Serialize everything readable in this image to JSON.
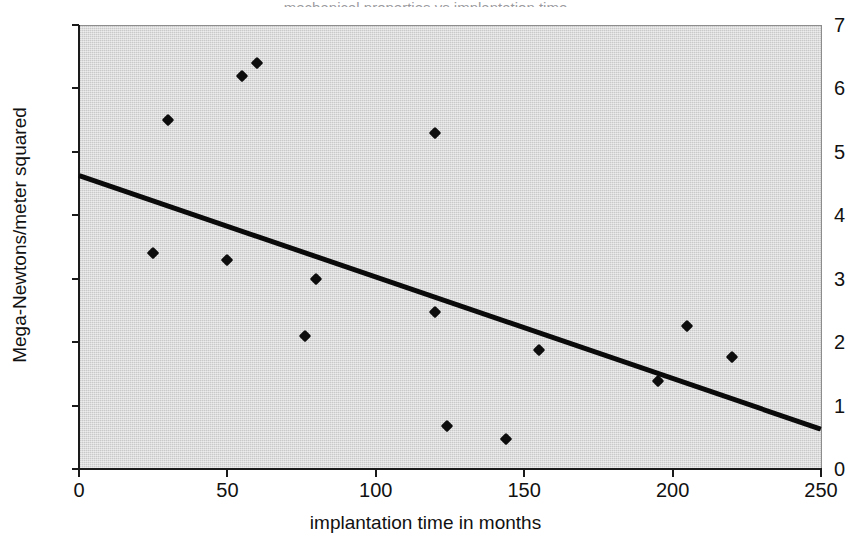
{
  "figure": {
    "background_color": "#ffffff",
    "plot_background_color": "#c9c9c9",
    "axis_color": "#1a1a1a",
    "marker_color": "#0d0d0d",
    "trend_color": "#0a0a0a",
    "cropped_title_sliver": "mechanical properties vs implantation time"
  },
  "chart_data": {
    "type": "scatter",
    "title": "",
    "xlabel": "implantation time in months",
    "ylabel": "Mega-Newtons/meter squared",
    "xlim": [
      0,
      250
    ],
    "ylim": [
      0,
      7
    ],
    "grid": false,
    "legend": null,
    "xticks": [
      0,
      50,
      100,
      150,
      200,
      250
    ],
    "xtick_labels": [
      "0",
      "50",
      "100",
      "150",
      "200",
      "250"
    ],
    "yticks": [
      0,
      1,
      2,
      3,
      4,
      5,
      6,
      7
    ],
    "ytick_labels": [
      "0",
      "1",
      "2",
      "3",
      "4",
      "5",
      "6",
      "7"
    ],
    "series": [
      {
        "name": "measurements",
        "marker": "diamond",
        "points": [
          {
            "x": 30,
            "y": 5.5
          },
          {
            "x": 55,
            "y": 6.2
          },
          {
            "x": 60,
            "y": 6.4
          },
          {
            "x": 120,
            "y": 5.3
          },
          {
            "x": 25,
            "y": 3.4
          },
          {
            "x": 50,
            "y": 3.3
          },
          {
            "x": 80,
            "y": 3.0
          },
          {
            "x": 76,
            "y": 2.1
          },
          {
            "x": 120,
            "y": 2.48
          },
          {
            "x": 124,
            "y": 0.68
          },
          {
            "x": 144,
            "y": 0.48
          },
          {
            "x": 155,
            "y": 1.87
          },
          {
            "x": 195,
            "y": 1.38
          },
          {
            "x": 205,
            "y": 2.25
          },
          {
            "x": 220,
            "y": 1.77
          }
        ]
      }
    ],
    "trendline": {
      "name": "linear fit",
      "x": [
        0,
        250
      ],
      "y": [
        4.62,
        0.62
      ],
      "slope": -0.016,
      "intercept": 4.62
    }
  }
}
